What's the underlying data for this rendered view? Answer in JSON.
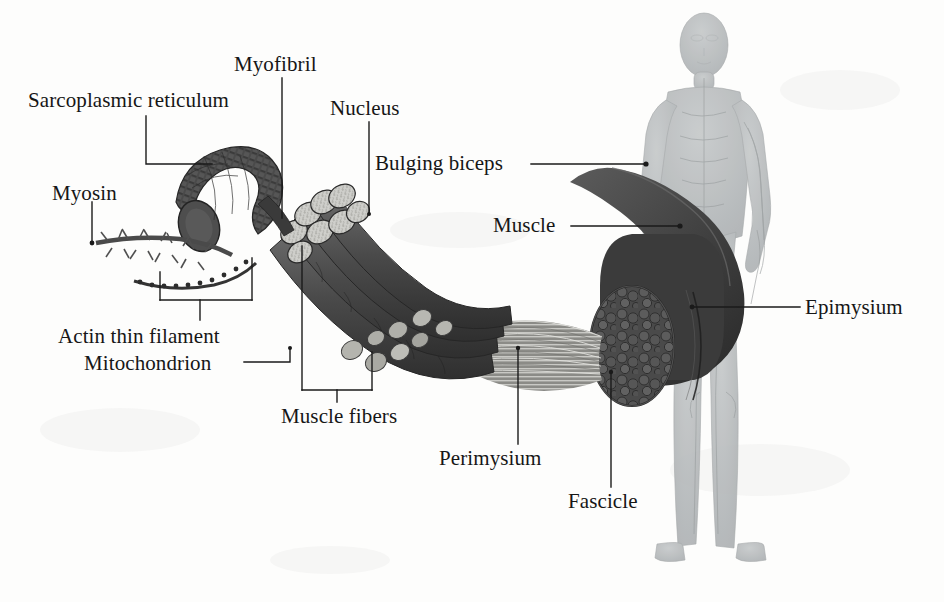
{
  "diagram": {
    "background_color": "#fdfdfc",
    "ink_color": "#161616",
    "muscle_fill": "#4b4b4b",
    "body_fill": "#b9bcbd"
  },
  "labels": {
    "sarcoplasmic_reticulum": "Sarcoplasmic reticulum",
    "myofibril": "Myofibril",
    "nucleus": "Nucleus",
    "myosin": "Myosin",
    "bulging_biceps": "Bulging biceps",
    "muscle": "Muscle",
    "actin_thin_filament": "Actin thin filament",
    "mitochondrion": "Mitochondrion",
    "muscle_fibers": "Muscle fibers",
    "perimysium": "Perimysium",
    "fascicle": "Fascicle",
    "epimysium": "Epimysium"
  },
  "structures": {
    "human_figure": "translucent-anatomical-human-body",
    "biceps_muscle": "dark-crescent-biceps-muscle",
    "muscle_cross_section": "fascicle-bundle-cross-section",
    "fascicle_bundle": "striated-fiber-bundle",
    "muscle_fiber_bundle": "cut-cylinder-muscle-fibers",
    "myofibril_tube": "curved-striated-myofibril",
    "myosin_filament": "thick-bristled-myosin-filament",
    "actin_filament": "thin-beaded-actin-filament",
    "mitochondria": "oval-mitochondria-beads"
  }
}
